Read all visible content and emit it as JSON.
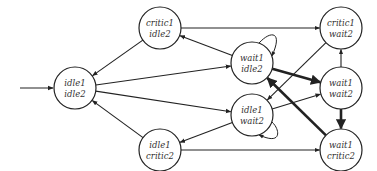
{
  "diagram": {
    "type": "state-transition-graph",
    "colors": {
      "stroke": "#222222",
      "background": "#ffffff",
      "text": "#333333"
    },
    "initial_state": "s0",
    "nodes": [
      {
        "id": "s0",
        "line1": "idle1",
        "line2": "idle2",
        "cx": 75,
        "cy": 88
      },
      {
        "id": "s1",
        "line1": "critic1",
        "line2": "idle2",
        "cx": 160,
        "cy": 28
      },
      {
        "id": "s2",
        "line1": "wait1",
        "line2": "idle2",
        "cx": 252,
        "cy": 63
      },
      {
        "id": "s3",
        "line1": "idle1",
        "line2": "wait2",
        "cx": 252,
        "cy": 115
      },
      {
        "id": "s4",
        "line1": "idle1",
        "line2": "critic2",
        "cx": 160,
        "cy": 150
      },
      {
        "id": "s5",
        "line1": "critic1",
        "line2": "wait2",
        "cx": 341,
        "cy": 28
      },
      {
        "id": "s6",
        "line1": "wait1",
        "line2": "wait2",
        "cx": 341,
        "cy": 88
      },
      {
        "id": "s7",
        "line1": "wait1",
        "line2": "critic2",
        "cx": 341,
        "cy": 150
      }
    ],
    "edges": [
      {
        "from": "s0",
        "to": "s2",
        "thick": false
      },
      {
        "from": "s0",
        "to": "s3",
        "thick": false
      },
      {
        "from": "s1",
        "to": "s0",
        "thick": false
      },
      {
        "from": "s4",
        "to": "s0",
        "thick": false
      },
      {
        "from": "s1",
        "to": "s5",
        "thick": false
      },
      {
        "from": "s2",
        "to": "s1",
        "thick": false
      },
      {
        "from": "s3",
        "to": "s4",
        "thick": false
      },
      {
        "from": "s4",
        "to": "s7",
        "thick": false
      },
      {
        "from": "s2",
        "to": "s6",
        "thick": true
      },
      {
        "from": "s7",
        "to": "s2",
        "thick": true
      },
      {
        "from": "s6",
        "to": "s7",
        "thick": true
      },
      {
        "from": "s6",
        "to": "s5",
        "thick": false
      },
      {
        "from": "s3",
        "to": "s6",
        "thick": false
      },
      {
        "from": "s5",
        "to": "s3",
        "thick": false
      },
      {
        "from": "s2",
        "to": "s2",
        "thick": false,
        "self_loop": true
      },
      {
        "from": "s3",
        "to": "s3",
        "thick": false,
        "self_loop": true
      }
    ]
  }
}
